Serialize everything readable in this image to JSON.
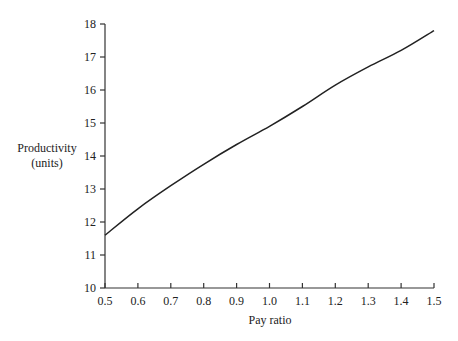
{
  "chart_data": {
    "type": "line",
    "title": "",
    "xlabel": "Pay ratio",
    "ylabel": [
      "Productivity",
      "(units)"
    ],
    "x": [
      0.5,
      0.6,
      0.7,
      0.8,
      0.9,
      1.0,
      1.1,
      1.2,
      1.3,
      1.4,
      1.5
    ],
    "series": [
      {
        "name": "Productivity",
        "values": [
          11.6,
          12.4,
          13.1,
          13.75,
          14.35,
          14.9,
          15.5,
          16.15,
          16.7,
          17.2,
          17.8
        ]
      }
    ],
    "xlim": [
      0.5,
      1.5
    ],
    "ylim": [
      10,
      18
    ],
    "x_ticks": [
      "0.5",
      "0.6",
      "0.7",
      "0.8",
      "0.9",
      "1.0",
      "1.1",
      "1.2",
      "1.3",
      "1.4",
      "1.5"
    ],
    "y_ticks": [
      "10",
      "11",
      "12",
      "13",
      "14",
      "15",
      "16",
      "17",
      "18"
    ],
    "grid": false,
    "legend": "none"
  }
}
